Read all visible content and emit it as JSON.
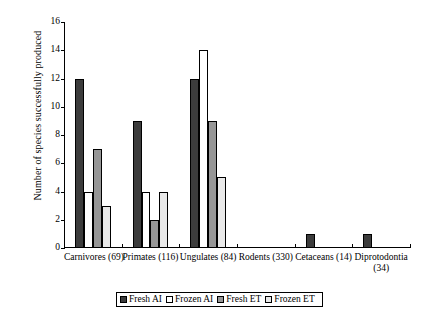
{
  "chart_data": {
    "type": "bar",
    "title": "",
    "xlabel": "",
    "ylabel": "Number of species successfully produced",
    "ylim": [
      0,
      16
    ],
    "yticks": [
      0,
      2,
      4,
      6,
      8,
      10,
      12,
      14,
      16
    ],
    "ytick_labels": [
      "0",
      "2",
      "4",
      "6",
      "8",
      "10",
      "12",
      "14",
      "16"
    ],
    "grid": false,
    "legend_position": "bottom",
    "categories": [
      "Carnivores (69)",
      "Primates (116)",
      "Ungulates (84)",
      "Rodents (330)",
      "Cetaceans (14)",
      "Diprotodontia (34)"
    ],
    "category_lines": [
      [
        "Carnivores (69)"
      ],
      [
        "Primates (116)"
      ],
      [
        "Ungulates (84)"
      ],
      [
        "Rodents (330)"
      ],
      [
        "Cetaceans (14)"
      ],
      [
        "Diprotodontia",
        "(34)"
      ]
    ],
    "series": [
      {
        "name": "Fresh AI",
        "color": "#3c3c3c",
        "values": [
          12,
          9,
          12,
          0,
          1,
          1
        ]
      },
      {
        "name": "Frozen AI",
        "color": "#ffffff",
        "values": [
          4,
          4,
          14,
          0,
          0,
          0
        ]
      },
      {
        "name": "Fresh ET",
        "color": "#969696",
        "values": [
          7,
          2,
          9,
          0,
          0,
          0
        ]
      },
      {
        "name": "Frozen ET",
        "color": "#e9e9e9",
        "values": [
          3,
          4,
          5,
          0,
          0,
          0
        ]
      }
    ]
  },
  "legend": {
    "items": [
      {
        "label": "Fresh AI"
      },
      {
        "label": "Frozen AI"
      },
      {
        "label": "Fresh ET"
      },
      {
        "label": "Frozen ET"
      }
    ]
  }
}
